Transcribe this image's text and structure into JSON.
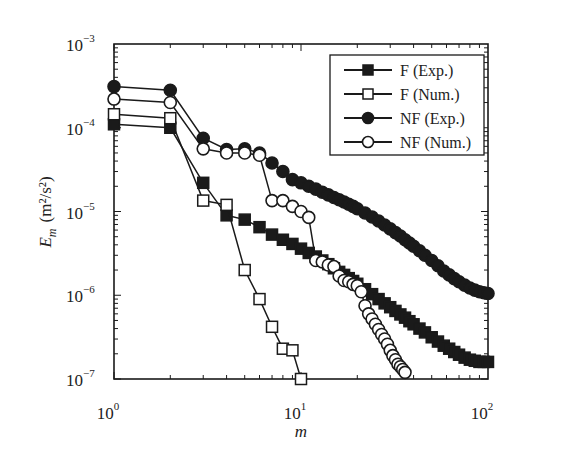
{
  "chart_data": {
    "type": "line",
    "scale": {
      "x": "log",
      "y": "log"
    },
    "title": "",
    "xlabel": "m",
    "ylabel": "E_m (m²/s²)",
    "ylabel_parts": {
      "symbol": "E",
      "subscript": "m",
      "units": "(m²/s²)"
    },
    "xlim": [
      1,
      100
    ],
    "ylim": [
      1e-07,
      0.001
    ],
    "x_ticks": [
      {
        "base": "10",
        "exp": "0",
        "value": 1
      },
      {
        "base": "10",
        "exp": "1",
        "value": 10
      },
      {
        "base": "10",
        "exp": "2",
        "value": 100
      }
    ],
    "y_ticks": [
      {
        "base": "10",
        "exp": "−3",
        "value": 0.001
      },
      {
        "base": "10",
        "exp": "−4",
        "value": 0.0001
      },
      {
        "base": "10",
        "exp": "−5",
        "value": 1e-05
      },
      {
        "base": "10",
        "exp": "−6",
        "value": 1e-06
      },
      {
        "base": "10",
        "exp": "−7",
        "value": 1e-07
      }
    ],
    "grid": false,
    "legend_position": "upper right",
    "series": [
      {
        "name": "F (Exp.)",
        "marker": "square",
        "filled": true,
        "x": [
          1,
          2,
          3,
          4,
          5,
          6,
          7,
          8,
          9,
          10,
          11,
          12,
          13,
          14,
          15,
          16,
          17,
          18,
          19,
          20,
          22,
          24,
          26,
          28,
          30,
          32,
          34,
          36,
          38,
          40,
          43,
          46,
          50,
          54,
          58,
          62,
          66,
          70,
          75,
          80,
          85,
          90,
          95,
          100
        ],
        "values": [
          0.00011,
          0.0001,
          2.2e-05,
          9e-06,
          8e-06,
          6.5e-06,
          5.3e-06,
          4.6e-06,
          4.1e-06,
          3.6e-06,
          3.2e-06,
          2.9e-06,
          2.6e-06,
          2.35e-06,
          2.1e-06,
          1.9e-06,
          1.75e-06,
          1.6e-06,
          1.48e-06,
          1.37e-06,
          1.18e-06,
          1.03e-06,
          9e-07,
          8e-07,
          7.2e-07,
          6.5e-07,
          5.9e-07,
          5.4e-07,
          4.9e-07,
          4.5e-07,
          4e-07,
          3.6e-07,
          3.15e-07,
          2.8e-07,
          2.5e-07,
          2.3e-07,
          2.1e-07,
          1.95e-07,
          1.8e-07,
          1.7e-07,
          1.65e-07,
          1.6e-07,
          1.6e-07,
          1.6e-07
        ]
      },
      {
        "name": "F (Num.)",
        "marker": "square",
        "filled": false,
        "x": [
          1,
          2,
          3,
          4,
          5,
          6,
          7,
          8,
          9,
          10
        ],
        "values": [
          0.000145,
          0.00013,
          1.35e-05,
          1.2e-05,
          2e-06,
          9e-07,
          4.2e-07,
          2.3e-07,
          2.2e-07,
          1e-07
        ]
      },
      {
        "name": "NF (Exp.)",
        "marker": "circle",
        "filled": true,
        "x": [
          1,
          2,
          3,
          4,
          5,
          6,
          7,
          8,
          9,
          10,
          11,
          12,
          13,
          14,
          15,
          16,
          17,
          18,
          19,
          20,
          22,
          24,
          26,
          28,
          30,
          32,
          34,
          36,
          38,
          40,
          43,
          46,
          50,
          54,
          58,
          62,
          66,
          70,
          75,
          80,
          85,
          90,
          95,
          100
        ],
        "values": [
          0.00031,
          0.00028,
          7.5e-05,
          5.5e-05,
          5.6e-05,
          5e-05,
          3.8e-05,
          3e-05,
          2.4e-05,
          2.2e-05,
          2e-05,
          1.85e-05,
          1.7e-05,
          1.58e-05,
          1.47e-05,
          1.38e-05,
          1.3e-05,
          1.22e-05,
          1.15e-05,
          1.08e-05,
          9.6e-06,
          8.6e-06,
          7.7e-06,
          6.9e-06,
          6.2e-06,
          5.6e-06,
          5.1e-06,
          4.6e-06,
          4.2e-06,
          3.85e-06,
          3.4e-06,
          3e-06,
          2.6e-06,
          2.25e-06,
          1.95e-06,
          1.75e-06,
          1.58e-06,
          1.45e-06,
          1.32e-06,
          1.22e-06,
          1.15e-06,
          1.1e-06,
          1.07e-06,
          1.05e-06
        ]
      },
      {
        "name": "NF (Num.)",
        "marker": "circle",
        "filled": false,
        "x": [
          1,
          2,
          3,
          4,
          5,
          6,
          7,
          8,
          9,
          10,
          11,
          12,
          13,
          14,
          15,
          16,
          17,
          18,
          19,
          20,
          21,
          22,
          23,
          24,
          25,
          26,
          27,
          28,
          29,
          30,
          31,
          32,
          33,
          34,
          35,
          36
        ],
        "values": [
          0.00022,
          0.0002,
          5.6e-05,
          5e-05,
          5e-05,
          4.7e-05,
          1.35e-05,
          1.35e-05,
          1.15e-05,
          1e-05,
          8.5e-06,
          2.6e-06,
          2.5e-06,
          2.3e-06,
          2.2e-06,
          1.7e-06,
          1.5e-06,
          1.45e-06,
          1.35e-06,
          1.3e-06,
          1.1e-06,
          7.5e-07,
          6e-07,
          5.2e-07,
          4.5e-07,
          3.9e-07,
          3.4e-07,
          3e-07,
          2.6e-07,
          2.2e-07,
          1.9e-07,
          1.7e-07,
          1.5e-07,
          1.4e-07,
          1.3e-07,
          1.2e-07
        ]
      }
    ]
  }
}
